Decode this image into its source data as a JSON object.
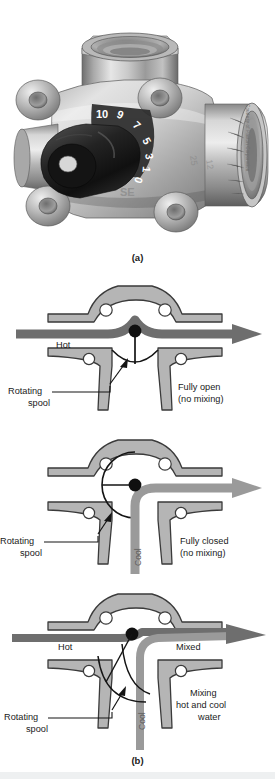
{
  "figure": {
    "caption_a": "(a)",
    "caption_b": "(b)",
    "credit": "Courtesy of Paxton Corporation"
  },
  "photo": {
    "alt_name": "three-way-mixing-valve-photograph",
    "dial_numbers": [
      "10",
      "9",
      "7",
      "5",
      "3",
      "1",
      "0"
    ],
    "body_text": "SE"
  },
  "diagrams": [
    {
      "id": "fully-open",
      "inlet_label": "Hot",
      "spool_label_line1": "Rotating",
      "spool_label_line2": "spool",
      "state_line1": "Fully open",
      "state_line2": "(no mixing)",
      "vertical_label": ""
    },
    {
      "id": "fully-closed",
      "inlet_label": "",
      "spool_label_line1": "Rotating",
      "spool_label_line2": "spool",
      "state_line1": "Fully closed",
      "state_line2": "(no mixing)",
      "vertical_label": "Cool"
    },
    {
      "id": "mixing",
      "inlet_label": "Hot",
      "outlet_label": "Mixed",
      "spool_label_line1": "Rotating",
      "spool_label_line2": "spool",
      "state_line1": "Mixing",
      "state_line2": "hot and cool",
      "state_line3": "water",
      "vertical_label": "Cool"
    }
  ],
  "colors": {
    "body_fill": "#b5b5b5",
    "body_stroke": "#3d3d3d",
    "flow_arrow": "#6e6e6e",
    "flow_arrow_dark": "#5a5a5a",
    "pivot": "#101010",
    "hole_fill": "#ffffff",
    "text": "#1a1a1a",
    "credit_text": "#6d6d6d",
    "background": "#ffffff"
  }
}
